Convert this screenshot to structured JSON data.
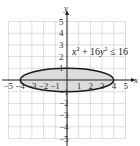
{
  "chart_data": {
    "type": "area",
    "title": "",
    "equation": "x² + 16y² ≤ 16",
    "equation_parts": {
      "x": "x",
      "plus": " + 16",
      "y": "y",
      "le": " ≤ 16"
    },
    "shape": "ellipse",
    "center": [
      0,
      0
    ],
    "semi_axis_x": 4,
    "semi_axis_y": 1,
    "boundary": "solid",
    "shaded": "inside",
    "xlabel": "x",
    "ylabel": "y",
    "xlim": [
      -5,
      5
    ],
    "ylim": [
      -5,
      5
    ],
    "grid": true,
    "x_ticks": [
      -5,
      -4,
      -3,
      -2,
      -1,
      1,
      2,
      3,
      4,
      5
    ],
    "x_tick_labels": [
      "−5",
      "−4",
      "−3",
      "−2",
      "−1",
      "1",
      "2",
      "3",
      "4",
      "5"
    ],
    "y_ticks": [
      -5,
      -4,
      -3,
      -2,
      -1,
      1,
      2,
      3,
      4,
      5
    ],
    "y_tick_labels": [
      "−5",
      "−4",
      "−3",
      "−2",
      "−1",
      "1",
      "2",
      "3",
      "4",
      "5"
    ],
    "colors": {
      "fill": "#dcdcdc",
      "stroke": "#1a1a1a",
      "grid": "#cfcfcf",
      "axis": "#222222"
    }
  }
}
